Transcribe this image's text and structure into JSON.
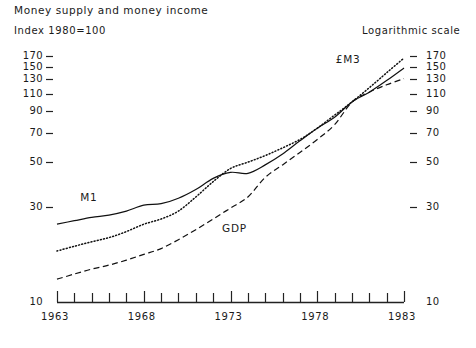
{
  "title": "Money supply and money income",
  "subtitle": "Index 1980=100",
  "scale_note": "Logarithmic scale",
  "labels": {
    "m1": "M1",
    "em3": "£M3",
    "gdp": "GDP"
  },
  "axis": {
    "y_ticks": [
      "170",
      "150",
      "130",
      "110",
      "90",
      "70",
      "50",
      "30",
      "10"
    ],
    "x_ticks": [
      "1963",
      "1968",
      "1973",
      "1978",
      "1983"
    ]
  },
  "chart_data": {
    "type": "line",
    "title": "Money supply and money income",
    "subtitle": "Index 1980=100",
    "xlabel": "",
    "ylabel": "Index 1980=100",
    "yscale": "log",
    "ylim": [
      10,
      180
    ],
    "xlim": [
      1963,
      1983
    ],
    "grid": false,
    "legend": "inline-annotations",
    "y_tick_values": [
      170,
      150,
      130,
      110,
      90,
      70,
      50,
      30,
      10
    ],
    "x_tick_values": [
      1963,
      1968,
      1973,
      1978,
      1983
    ],
    "x_minor_ticks": [
      1964,
      1965,
      1966,
      1967,
      1969,
      1970,
      1971,
      1972,
      1974,
      1975,
      1976,
      1977,
      1979,
      1980,
      1981,
      1982
    ],
    "x": [
      1963,
      1964,
      1965,
      1966,
      1967,
      1968,
      1969,
      1970,
      1971,
      1972,
      1973,
      1974,
      1975,
      1976,
      1977,
      1978,
      1979,
      1980,
      1981,
      1982,
      1983
    ],
    "series": [
      {
        "name": "M1",
        "style": "solid",
        "color": "#111111",
        "values": [
          24.5,
          25.5,
          26.5,
          27.2,
          28.5,
          30.5,
          31.0,
          33.0,
          36.5,
          41.5,
          44.5,
          44.0,
          48.5,
          55.0,
          64.0,
          74.0,
          84.0,
          100.0,
          112.0,
          128.0,
          148.0
        ]
      },
      {
        "name": "£M3",
        "style": "dotted",
        "color": "#111111",
        "values": [
          18.0,
          19.0,
          20.0,
          21.0,
          22.5,
          24.5,
          26.0,
          28.5,
          33.5,
          40.0,
          46.5,
          50.0,
          54.0,
          59.0,
          65.0,
          74.0,
          86.0,
          100.0,
          118.0,
          140.0,
          166.0
        ]
      },
      {
        "name": "GDP",
        "style": "dashed",
        "color": "#111111",
        "values": [
          13.0,
          13.8,
          14.6,
          15.3,
          16.2,
          17.3,
          18.5,
          20.5,
          23.0,
          26.0,
          29.5,
          33.5,
          42.0,
          48.5,
          56.0,
          65.0,
          77.0,
          100.0,
          112.0,
          122.0,
          131.0
        ]
      }
    ]
  }
}
